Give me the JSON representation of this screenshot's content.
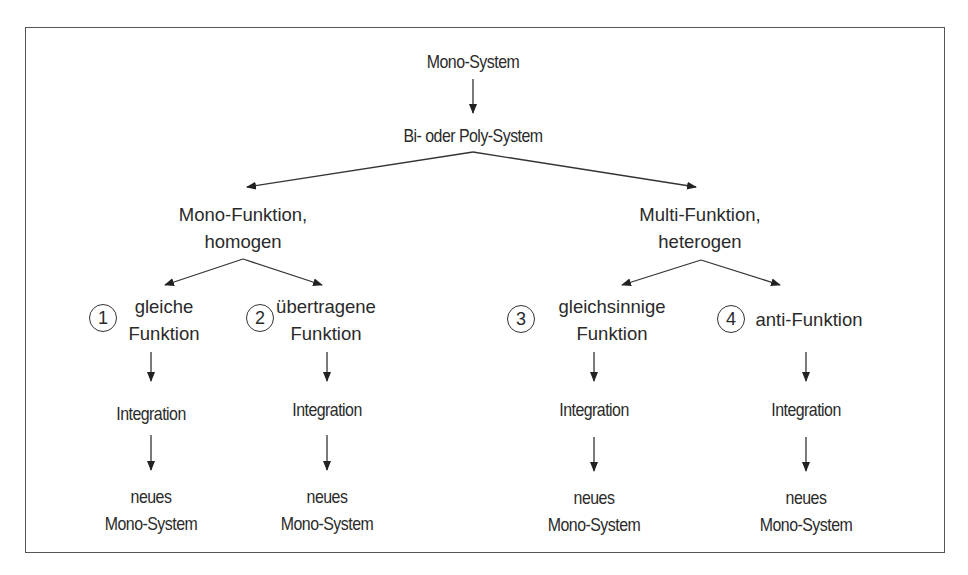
{
  "diagram": {
    "root": "Mono-System",
    "level1": "Bi- oder Poly-System",
    "branches": [
      {
        "label_line1": "Mono-Funktion,",
        "label_line2": "homogen",
        "children": [
          {
            "number": "1",
            "line1": "gleiche",
            "line2": "Funktion",
            "step": "Integration",
            "result_line1": "neues",
            "result_line2": "Mono-System"
          },
          {
            "number": "2",
            "line1": "übertragene",
            "line2": "Funktion",
            "step": "Integration",
            "result_line1": "neues",
            "result_line2": "Mono-System"
          }
        ]
      },
      {
        "label_line1": "Multi-Funktion,",
        "label_line2": "heterogen",
        "children": [
          {
            "number": "3",
            "line1": "gleichsinnige",
            "line2": "Funktion",
            "step": "Integration",
            "result_line1": "neues",
            "result_line2": "Mono-System"
          },
          {
            "number": "4",
            "line1": "anti-Funktion",
            "line2": "",
            "step": "Integration",
            "result_line1": "neues",
            "result_line2": "Mono-System"
          }
        ]
      }
    ]
  },
  "colors": {
    "line": "#333333",
    "text": "#2a2a2a",
    "border": "#555555"
  }
}
